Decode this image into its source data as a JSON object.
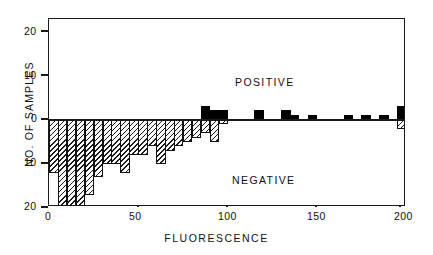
{
  "chart_data": {
    "type": "bar",
    "title": "",
    "subtitle": "",
    "xlabel": "FLUORESCENCE",
    "ylabel": "NO. OF SAMPLES",
    "xlim": [
      0,
      200
    ],
    "ylim": [
      -22,
      22
    ],
    "grid": false,
    "legend_position": "in-plot-annotations",
    "orientation": "back-to-back-histogram",
    "bin_width": 5,
    "x_ticks": [
      0,
      50,
      100,
      150,
      200
    ],
    "x_tick_labels": [
      "0",
      "50",
      "100",
      "150",
      "200"
    ],
    "y_ticks": [
      20,
      10,
      0,
      10,
      20
    ],
    "y_tick_labels": [
      "20",
      "10",
      "0",
      "10",
      "20"
    ],
    "annotations": [
      {
        "text": "POSITIVE",
        "region": "above-axis"
      },
      {
        "text": "NEGATIVE",
        "region": "below-axis"
      }
    ],
    "series": [
      {
        "name": "POSITIVE",
        "direction": "up",
        "fill": "solid-black",
        "color": "#000000",
        "bins": [
          {
            "x0": 85,
            "x1": 90,
            "value": 3
          },
          {
            "x0": 90,
            "x1": 95,
            "value": 2
          },
          {
            "x0": 95,
            "x1": 100,
            "value": 2
          },
          {
            "x0": 115,
            "x1": 120,
            "value": 2
          },
          {
            "x0": 130,
            "x1": 135,
            "value": 2
          },
          {
            "x0": 135,
            "x1": 140,
            "value": 1
          },
          {
            "x0": 145,
            "x1": 150,
            "value": 1
          },
          {
            "x0": 165,
            "x1": 170,
            "value": 1
          },
          {
            "x0": 175,
            "x1": 180,
            "value": 1
          },
          {
            "x0": 185,
            "x1": 190,
            "value": 1
          },
          {
            "x0": 195,
            "x1": 200,
            "value": 3
          }
        ]
      },
      {
        "name": "NEGATIVE",
        "direction": "down",
        "fill": "diagonal-hatch",
        "color": "#1a1a1a",
        "bins": [
          {
            "x0": 0,
            "x1": 5,
            "value": 12
          },
          {
            "x0": 5,
            "x1": 10,
            "value": 21
          },
          {
            "x0": 10,
            "x1": 15,
            "value": 21
          },
          {
            "x0": 15,
            "x1": 20,
            "value": 21
          },
          {
            "x0": 20,
            "x1": 25,
            "value": 17
          },
          {
            "x0": 25,
            "x1": 30,
            "value": 13
          },
          {
            "x0": 30,
            "x1": 35,
            "value": 10
          },
          {
            "x0": 35,
            "x1": 40,
            "value": 10
          },
          {
            "x0": 40,
            "x1": 45,
            "value": 12
          },
          {
            "x0": 45,
            "x1": 50,
            "value": 8
          },
          {
            "x0": 50,
            "x1": 55,
            "value": 8
          },
          {
            "x0": 55,
            "x1": 60,
            "value": 6
          },
          {
            "x0": 60,
            "x1": 65,
            "value": 10
          },
          {
            "x0": 65,
            "x1": 70,
            "value": 7
          },
          {
            "x0": 70,
            "x1": 75,
            "value": 6
          },
          {
            "x0": 75,
            "x1": 80,
            "value": 5
          },
          {
            "x0": 80,
            "x1": 85,
            "value": 4
          },
          {
            "x0": 85,
            "x1": 90,
            "value": 3
          },
          {
            "x0": 90,
            "x1": 95,
            "value": 5
          },
          {
            "x0": 95,
            "x1": 100,
            "value": 1
          },
          {
            "x0": 195,
            "x1": 200,
            "value": 2
          }
        ]
      }
    ]
  }
}
